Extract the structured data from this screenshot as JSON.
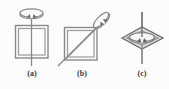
{
  "figure": {
    "name": "rotation-axes-of-a-square",
    "background_color": "#fcfcfc",
    "stroke_color": "#8a8a8a",
    "stroke_dark_color": "#6e6e6e",
    "label_color": "#3a3a3a",
    "fill_color": "#e3e3e3",
    "width": 169,
    "height": 89
  },
  "panels": [
    {
      "id": "a",
      "label": "(a)",
      "shape": "square",
      "axis": "vertical axis through centre of square faces",
      "rotation_indicator": "curved-arrow-ellipse-above-axis",
      "axis_line": {
        "x1": 31.5,
        "y1": 14,
        "x2": 31.5,
        "y2": 66
      },
      "square_outer": {
        "x": 15,
        "y": 25,
        "width": 33,
        "height": 33
      },
      "square_inner": {
        "x": 18,
        "y": 28,
        "width": 27,
        "height": 27
      }
    },
    {
      "id": "b",
      "label": "(b)",
      "shape": "square",
      "axis": "diagonal axis through opposite corners",
      "rotation_indicator": "tilted-curved-arrow-ellipse-on-axis",
      "axis_line": {
        "x1": 58,
        "y1": 66,
        "x2": 110,
        "y2": 14
      },
      "square_outer": {
        "x": 64,
        "y": 27,
        "width": 33,
        "height": 33
      },
      "square_inner": {
        "x": 67,
        "y": 30,
        "width": 27,
        "height": 27
      }
    },
    {
      "id": "c",
      "label": "(c)",
      "shape": "rhombus-edge-on-square",
      "axis": "vertical axis through edge-on square",
      "rotation_indicator": "flat-curved-arrow-ellipse-inside-rhombus",
      "axis_line": {
        "x1": 142,
        "y1": 12,
        "x2": 142,
        "y2": 64
      },
      "rhombus_outer": [
        [
          122,
          38
        ],
        [
          142,
          27
        ],
        [
          163,
          38
        ],
        [
          142,
          49
        ]
      ],
      "rhombus_inner": [
        [
          127,
          38
        ],
        [
          142,
          31
        ],
        [
          158,
          38
        ],
        [
          142,
          45
        ]
      ]
    }
  ],
  "labels": {
    "a": "(a)",
    "b": "(b)",
    "c": "(c)"
  }
}
